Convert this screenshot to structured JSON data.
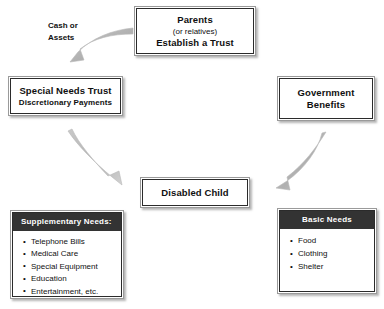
{
  "diagram": {
    "colors": {
      "box_border_outer": "#9a9a9a",
      "box_border_inner": "#2b2b2b",
      "box_fill": "#ffffff",
      "list_header_fill": "#333333",
      "list_header_text": "#ffffff",
      "arrow_fill": "#b4b4b4",
      "text": "#101010",
      "background": "#ffffff"
    },
    "nodes": {
      "parents": {
        "line1": "Parents",
        "line2": "(or relatives)",
        "line3": "Establish a Trust"
      },
      "special_needs_trust": {
        "line1": "Special Needs Trust",
        "line2": "Discretionary Payments"
      },
      "government_benefits": {
        "line1": "Government",
        "line2": "Benefits"
      },
      "disabled_child": {
        "line1": "Disabled Child"
      },
      "supplementary_needs": {
        "header": "Supplementary Needs:",
        "items": [
          "Telephone Bills",
          "Medical Care",
          "Special Equipment",
          "Education",
          "Entertainment, etc."
        ]
      },
      "basic_needs": {
        "header": "Basic Needs",
        "items": [
          "Food",
          "Clothing",
          "Shelter"
        ]
      }
    },
    "labels": {
      "cash_or_assets_line1": "Cash or",
      "cash_or_assets_line2": "Assets"
    },
    "connectors": [
      {
        "name": "parents-to-trust",
        "from": "parents",
        "to": "special_needs_trust",
        "label": "Cash or Assets",
        "style": "curved-arrow",
        "direction": "down-left"
      },
      {
        "name": "trust-to-child",
        "from": "special_needs_trust",
        "to": "disabled_child",
        "label": "",
        "style": "curved-arrow",
        "direction": "down-right"
      },
      {
        "name": "benefits-to-child",
        "from": "government_benefits",
        "to": "disabled_child",
        "label": "",
        "style": "curved-arrow",
        "direction": "down-left"
      }
    ]
  }
}
